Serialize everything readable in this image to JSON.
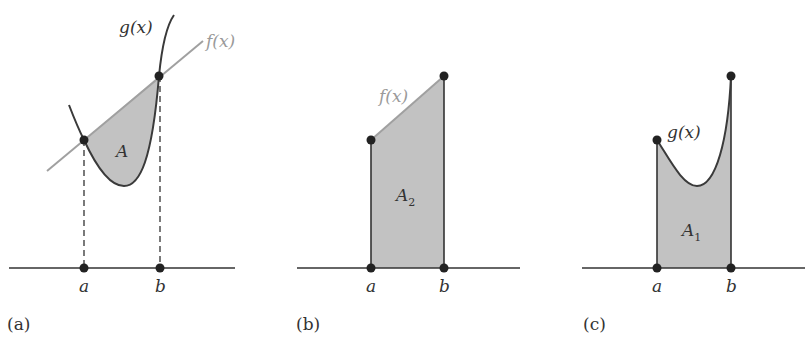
{
  "colors": {
    "axis": "#333333",
    "g_curve": "#3a3a3a",
    "f_line": "#a0a0a0",
    "fill": "#c2c2c2",
    "points": "#222222",
    "text": "#333333",
    "f_label": "#9a9a9a"
  },
  "panels": [
    {
      "caption": "(a)",
      "function_labels": {
        "g": "g(x)",
        "f": "f(x)"
      },
      "area_label": "A",
      "axis_labels": {
        "a": "a",
        "b": "b"
      },
      "description": "Area A between line f(x) and curve g(x) from a to b, with dashed projections to the x-axis"
    },
    {
      "caption": "(b)",
      "function_labels": {
        "f": "f(x)"
      },
      "area_label": "A",
      "area_subscript": "2",
      "axis_labels": {
        "a": "a",
        "b": "b"
      },
      "description": "Area A2 under line f(x) from a to b"
    },
    {
      "caption": "(c)",
      "function_labels": {
        "g": "g(x)"
      },
      "area_label": "A",
      "area_subscript": "1",
      "axis_labels": {
        "a": "a",
        "b": "b"
      },
      "description": "Area A1 under curve g(x) from a to b"
    }
  ]
}
